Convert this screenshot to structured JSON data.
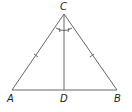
{
  "diagram": {
    "type": "isosceles triangle with angle bisector",
    "points": {
      "A": {
        "label": "A",
        "x": 12,
        "y": 90
      },
      "B": {
        "label": "B",
        "x": 117,
        "y": 90
      },
      "C": {
        "label": "C",
        "x": 64,
        "y": 14
      },
      "D": {
        "label": "D",
        "x": 64,
        "y": 90
      }
    },
    "segments": [
      "AC",
      "BC",
      "AB",
      "CD"
    ],
    "markings": {
      "congruent_sides": [
        "AC",
        "BC"
      ],
      "congruent_angles": [
        "ACD",
        "BCD"
      ]
    },
    "colors": {
      "line": "#666666",
      "label": "#222222"
    }
  }
}
